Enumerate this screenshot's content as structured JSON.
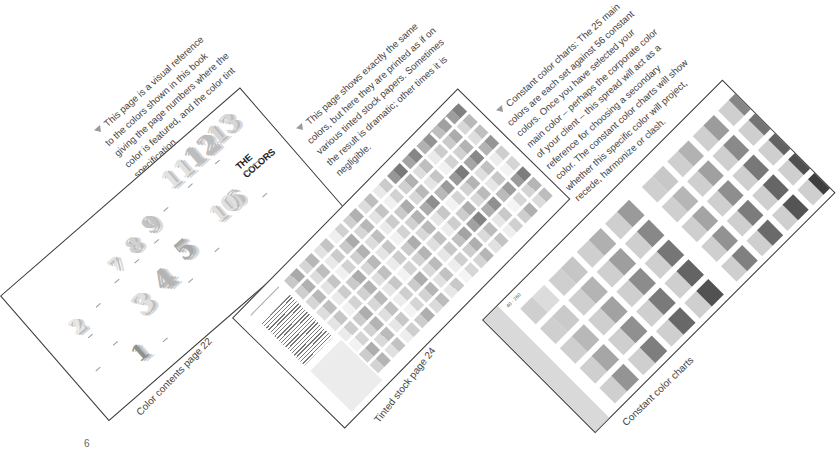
{
  "page_number": "6",
  "spreads": [
    {
      "id": "color-contents",
      "caption_label": "Color contents page 22",
      "description_lines": [
        "This page is a visual reference",
        "to the colors shown in this book",
        "giving the page numbers where the",
        "color is featured, and the color tint",
        "specification."
      ],
      "heading": "THE COLORS",
      "numbers": [
        "12",
        "13",
        "11",
        "9",
        "8",
        "7",
        "5",
        "4",
        "3",
        "2",
        "6",
        "10",
        "1"
      ]
    },
    {
      "id": "tinted-stock",
      "caption_label": "Tinted stock page 24",
      "description_lines": [
        "This page shows exactly the same",
        "colors, but here they are printed as if on",
        "various tinted stock papers. Sometimes",
        "the result is dramatic; other times it is",
        "negligible."
      ]
    },
    {
      "id": "constant-color-charts",
      "caption_label": "Constant color charts",
      "corner_code": "40 · 260",
      "description_lines": [
        "Constant color charts: The 25 main",
        "colors are each set against 56 constant",
        "colors. Once you have selected your",
        "main color – perhaps the corporate color",
        "of your client – this spread will act as a",
        "reference for choosing a secondary",
        "color. The constant color charts will show",
        "whether this specific color will project,",
        "recede, harmonize or clash."
      ]
    }
  ],
  "colors": {
    "border": "#3a3a3a",
    "text": "#444444",
    "bullet": "#9a9a9a"
  }
}
